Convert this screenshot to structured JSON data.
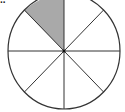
{
  "label": "..",
  "diagram": {
    "type": "fraction-circle",
    "slices": 8,
    "shaded_slices": 1,
    "shaded_position": "top-left (between 12 o'clock and 10:30)",
    "colors": {
      "shade": "#a9a9a9",
      "stroke": "#333333",
      "fill": "#ffffff"
    }
  }
}
